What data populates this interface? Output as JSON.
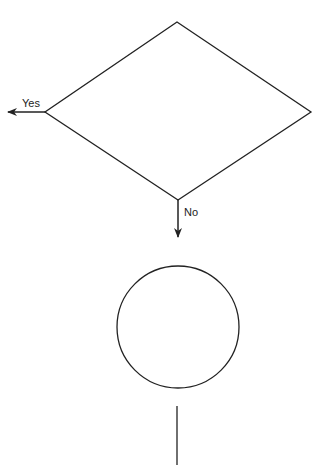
{
  "diagram": {
    "type": "flowchart",
    "colors": {
      "stroke": "#222222",
      "background": "#ffffff"
    },
    "nodes": [
      {
        "id": "decision",
        "shape": "diamond",
        "label": ""
      },
      {
        "id": "connector",
        "shape": "circle",
        "label": ""
      }
    ],
    "edges": [
      {
        "from": "decision",
        "to": "left",
        "label": "Yes"
      },
      {
        "from": "decision",
        "to": "connector",
        "label": "No"
      },
      {
        "from": "connector",
        "to": "below",
        "label": ""
      }
    ],
    "labels": {
      "yes": "Yes",
      "no": "No"
    }
  }
}
